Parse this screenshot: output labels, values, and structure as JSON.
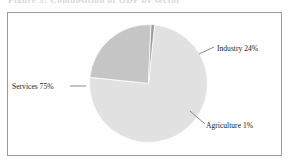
{
  "page": {
    "top_cutoff_text": "Figure 3: Composition of GDP by sector",
    "frame_border_color": "#9a9a9a",
    "background_color": "#ffffff"
  },
  "chart_data": {
    "type": "pie",
    "title": "",
    "subtitle": "",
    "xlabel": "",
    "ylabel": "",
    "legend_position": "none",
    "grid": false,
    "labels_show_percent": true,
    "categories": [
      "Services",
      "Industry",
      "Agriculture"
    ],
    "values": [
      75,
      24,
      1
    ],
    "units": "%",
    "colors": [
      "#e2e2e2",
      "#c6c6c6",
      "#9d9d9d"
    ],
    "slices": [
      {
        "name": "Services",
        "value": 75,
        "label": "Services 75%",
        "color": "#e2e2e2",
        "label_x": 12,
        "label_y": 89,
        "leader": "M 70 86 L 86 86"
      },
      {
        "name": "Industry",
        "value": 24,
        "label": "Industry 24%",
        "color": "#c6c6c6",
        "label_x": 217,
        "label_y": 51,
        "leader": "M 199 54 L 214 47"
      },
      {
        "name": "Agriculture",
        "value": 1,
        "label": "Agriculture 1%",
        "color": "#9d9d9d",
        "label_x": 206,
        "label_y": 128,
        "leader": "M 190 111 L 205 124"
      }
    ],
    "geometry": {
      "center_x": 148.5,
      "center_y": 83.5,
      "radius": 59,
      "start_angle_deg": -84
    }
  }
}
